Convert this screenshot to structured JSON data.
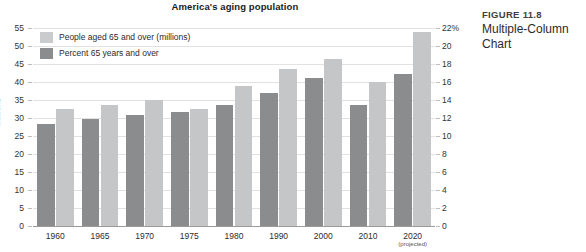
{
  "caption": {
    "figure_number": "FIGURE 11.8",
    "figure_title": "Multiple-Column Chart"
  },
  "legend": {
    "position": "top-left",
    "items": [
      {
        "label": "People aged 65 and over (millions)",
        "color": "#c9cbcd",
        "swatch": "light"
      },
      {
        "label": "Percent 65 years and over",
        "color": "#8a8c8e",
        "swatch": "dark"
      }
    ]
  },
  "axes": {
    "left_title": "Millions",
    "left_ticks": [
      "0",
      "5",
      "10",
      "15",
      "20",
      "25",
      "30",
      "35",
      "40",
      "45",
      "50",
      "55"
    ],
    "right_ticks": [
      "0",
      "2",
      "4",
      "6",
      "8",
      "10",
      "12",
      "14",
      "16",
      "18",
      "20",
      "22%"
    ],
    "x_note": "(projected)"
  },
  "chart_data": {
    "type": "bar",
    "title": "America's aging population",
    "xlabel": "",
    "ylabel": "Millions",
    "y2label": "Percent",
    "categories": [
      "1960",
      "1965",
      "1970",
      "1975",
      "1980",
      "1990",
      "2000",
      "2010",
      "2020"
    ],
    "series": [
      {
        "name": "Percent 65 years and over",
        "axis": "right",
        "color": "#8a8c8e",
        "unit": "%",
        "values": [
          11.3,
          11.9,
          12.3,
          12.7,
          13.4,
          14.8,
          16.5,
          13.4,
          16.9
        ]
      },
      {
        "name": "People aged 65 and over (millions)",
        "axis": "left",
        "color": "#c4c6c8",
        "unit": "millions",
        "values": [
          32.5,
          33.5,
          35.0,
          32.5,
          39.0,
          43.5,
          46.5,
          40.0,
          54.0
        ]
      }
    ],
    "ylim": [
      0,
      55
    ],
    "y2lim": [
      0,
      22
    ],
    "grid": true,
    "legend_position": "top-left"
  }
}
